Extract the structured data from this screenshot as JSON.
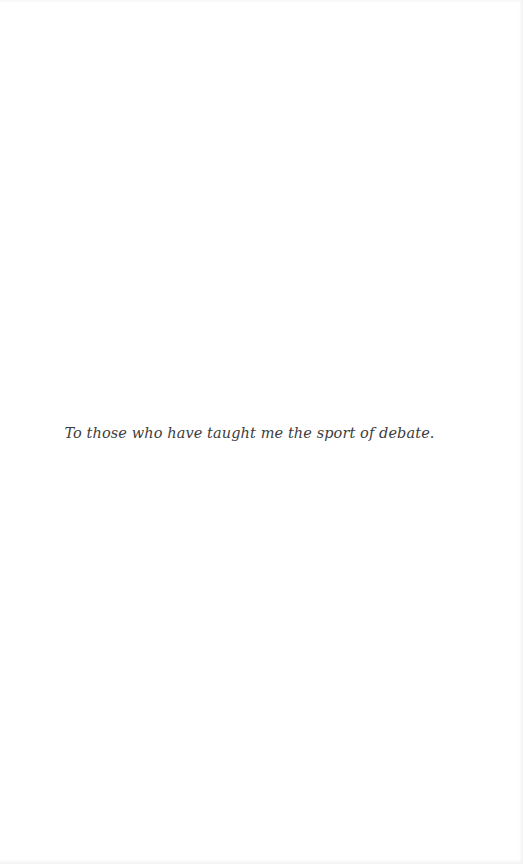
{
  "page": {
    "type": "book-dedication-page",
    "dedication_text": "To those who have taught me the sport of debate.",
    "text_color": "#3d3d3d",
    "background_color": "#ffffff",
    "edge_shade_color": "#f2f2f2"
  }
}
